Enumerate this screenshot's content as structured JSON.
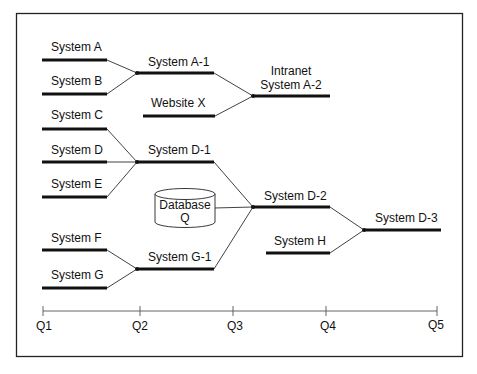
{
  "diagram": {
    "frame_color": "#222222",
    "line_color": "#111111",
    "nodes": {
      "system_a": "System A",
      "system_b": "System B",
      "system_a1": "System A-1",
      "website_x": "Website X",
      "intranet_line1": "Intranet",
      "intranet_line2": "System A-2",
      "system_c": "System C",
      "system_d": "System D",
      "system_e": "System E",
      "system_d1": "System D-1",
      "database_line1": "Database",
      "database_line2": "Q",
      "system_d2": "System D-2",
      "system_f": "System F",
      "system_g": "System G",
      "system_g1": "System G-1",
      "system_h": "System H",
      "system_d3": "System D-3"
    },
    "edges": [
      [
        "System A",
        "System A-1"
      ],
      [
        "System B",
        "System A-1"
      ],
      [
        "System A-1",
        "Intranet System A-2"
      ],
      [
        "Website X",
        "Intranet System A-2"
      ],
      [
        "System C",
        "System D-1"
      ],
      [
        "System D",
        "System D-1"
      ],
      [
        "System E",
        "System D-1"
      ],
      [
        "System D-1",
        "System D-2"
      ],
      [
        "Database Q",
        "System D-2"
      ],
      [
        "System G-1",
        "System D-2"
      ],
      [
        "System F",
        "System G-1"
      ],
      [
        "System G",
        "System G-1"
      ],
      [
        "System D-2",
        "System D-3"
      ],
      [
        "System H",
        "System D-3"
      ]
    ],
    "axis": {
      "ticks": [
        "Q1",
        "Q2",
        "Q3",
        "Q4",
        "Q5"
      ]
    }
  }
}
